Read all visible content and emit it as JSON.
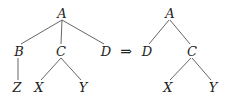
{
  "diagram": {
    "transform_arrow": "⇒",
    "left_tree": {
      "nodes": [
        {
          "id": "A",
          "label": "A",
          "x": 62,
          "y": 13
        },
        {
          "id": "B",
          "label": "B",
          "x": 19,
          "y": 51
        },
        {
          "id": "C",
          "label": "C",
          "x": 61,
          "y": 51
        },
        {
          "id": "D",
          "label": "D",
          "x": 106,
          "y": 51
        },
        {
          "id": "Z",
          "label": "Z",
          "x": 17,
          "y": 87
        },
        {
          "id": "X",
          "label": "X",
          "x": 39,
          "y": 87
        },
        {
          "id": "Y",
          "label": "Y",
          "x": 83,
          "y": 87
        }
      ],
      "edges": [
        [
          "A",
          "B"
        ],
        [
          "A",
          "C"
        ],
        [
          "A",
          "D"
        ],
        [
          "B",
          "Z"
        ],
        [
          "C",
          "X"
        ],
        [
          "C",
          "Y"
        ]
      ]
    },
    "right_tree": {
      "nodes": [
        {
          "id": "A",
          "label": "A",
          "x": 170,
          "y": 13
        },
        {
          "id": "D",
          "label": "D",
          "x": 147,
          "y": 51
        },
        {
          "id": "C",
          "label": "C",
          "x": 192,
          "y": 51
        },
        {
          "id": "X",
          "label": "X",
          "x": 168,
          "y": 87
        },
        {
          "id": "Y",
          "label": "Y",
          "x": 213,
          "y": 87
        }
      ],
      "edges": [
        [
          "A",
          "D"
        ],
        [
          "A",
          "C"
        ],
        [
          "C",
          "X"
        ],
        [
          "C",
          "Y"
        ]
      ]
    }
  }
}
